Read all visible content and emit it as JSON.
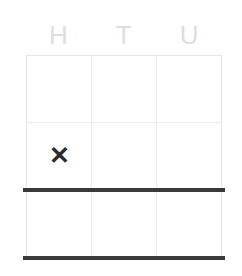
{
  "worksheet": {
    "title": "Place value grid",
    "columns": [
      {
        "key": "hundreds",
        "label": "H"
      },
      {
        "key": "tens",
        "label": "T"
      },
      {
        "key": "units",
        "label": "U"
      }
    ],
    "rows": [
      {
        "index": 1,
        "cells": [
          {
            "value": ""
          },
          {
            "value": ""
          },
          {
            "value": ""
          }
        ]
      },
      {
        "index": 2,
        "cells": [
          {
            "value": "✕"
          },
          {
            "value": ""
          },
          {
            "value": ""
          }
        ]
      },
      {
        "index": 3,
        "cells": [
          {
            "value": ""
          },
          {
            "value": ""
          },
          {
            "value": ""
          }
        ]
      }
    ],
    "rules": [
      {
        "name": "answer-rule",
        "after_row": 2
      },
      {
        "name": "bottom-rule",
        "after_row": 3
      }
    ],
    "colors": {
      "header_text": "#dedede",
      "grid_line": "#ededed",
      "grid_border": "#e6e6e6",
      "mark": "#2c2c2c",
      "thick_rule": "#3a3a3a",
      "background": "#ffffff"
    }
  }
}
